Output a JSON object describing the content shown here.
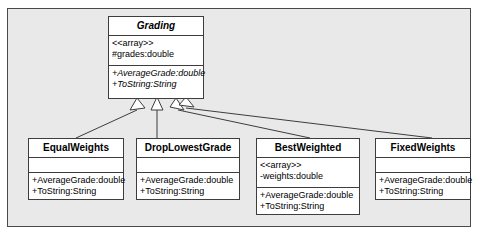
{
  "diagram": {
    "frame_background": "#e9e9e9",
    "box_background": "#ffffff",
    "line_color": "#3d3d3d"
  },
  "base_class": {
    "name": "Grading",
    "abstract": true,
    "attributes": [
      "<<array>>",
      "#grades:double"
    ],
    "operations": [
      "+AverageGrade:double",
      "+ToString:String"
    ]
  },
  "subclasses": [
    {
      "name": "EqualWeights",
      "abstract": false,
      "attributes": [],
      "operations": [
        "+AverageGrade:double",
        "+ToString:String"
      ]
    },
    {
      "name": "DropLowestGrade",
      "abstract": false,
      "attributes": [],
      "operations": [
        "+AverageGrade:double",
        "+ToString:String"
      ]
    },
    {
      "name": "BestWeighted",
      "abstract": false,
      "attributes": [
        "<<array>>",
        "-weights:double"
      ],
      "operations": [
        "+AverageGrade:double",
        "+ToString:String"
      ]
    },
    {
      "name": "FixedWeights",
      "abstract": false,
      "attributes": [],
      "operations": [
        "+AverageGrade:double",
        "+ToString:String"
      ]
    }
  ],
  "relationships": [
    {
      "type": "generalization",
      "from": "EqualWeights",
      "to": "Grading"
    },
    {
      "type": "generalization",
      "from": "DropLowestGrade",
      "to": "Grading"
    },
    {
      "type": "generalization",
      "from": "BestWeighted",
      "to": "Grading"
    },
    {
      "type": "generalization",
      "from": "FixedWeights",
      "to": "Grading"
    }
  ]
}
